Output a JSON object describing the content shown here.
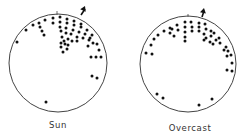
{
  "diagrams": [
    {
      "id": "sun",
      "label": "Sun",
      "circle": {
        "cx": 58,
        "cy": 63,
        "r": 49
      },
      "tick": {
        "x": 57,
        "y1": 11,
        "y2": 15
      },
      "arrow": {
        "x1": 81,
        "y1": 15,
        "x2": 85,
        "y2": 6
      },
      "dots": [
        [
          17,
          42
        ],
        [
          26,
          30
        ],
        [
          33,
          25
        ],
        [
          39,
          23
        ],
        [
          45,
          20
        ],
        [
          53,
          18
        ],
        [
          60,
          17
        ],
        [
          67,
          19
        ],
        [
          74,
          21
        ],
        [
          81,
          24
        ],
        [
          40,
          27
        ],
        [
          42,
          31
        ],
        [
          44,
          35
        ],
        [
          53,
          23
        ],
        [
          60,
          22
        ],
        [
          67,
          23
        ],
        [
          74,
          25
        ],
        [
          81,
          27
        ],
        [
          87,
          30
        ],
        [
          92,
          35
        ],
        [
          60,
          27
        ],
        [
          66,
          28
        ],
        [
          73,
          30
        ],
        [
          79,
          32
        ],
        [
          85,
          34
        ],
        [
          90,
          38
        ],
        [
          61,
          31
        ],
        [
          66,
          33
        ],
        [
          71,
          34
        ],
        [
          77,
          37
        ],
        [
          83,
          38
        ],
        [
          89,
          40
        ],
        [
          93,
          43
        ],
        [
          97,
          44
        ],
        [
          62,
          37
        ],
        [
          64,
          41
        ],
        [
          68,
          39
        ],
        [
          72,
          41
        ],
        [
          77,
          41
        ],
        [
          61,
          43
        ],
        [
          65,
          44
        ],
        [
          68,
          45
        ],
        [
          88,
          46
        ],
        [
          61,
          47
        ],
        [
          67,
          49
        ],
        [
          63,
          52
        ],
        [
          99,
          50
        ],
        [
          91,
          57
        ],
        [
          96,
          57
        ],
        [
          101,
          57
        ],
        [
          92,
          76
        ],
        [
          97,
          78
        ],
        [
          46,
          102
        ]
      ]
    },
    {
      "id": "overcast",
      "label": "Overcast",
      "circle": {
        "cx": 188,
        "cy": 64,
        "r": 48
      },
      "tick": {
        "x": 188,
        "y1": 14,
        "y2": 17
      },
      "arrow": {
        "x1": 202,
        "y1": 17,
        "x2": 204,
        "y2": 8
      },
      "dots": [
        [
          146,
          53
        ],
        [
          151,
          45
        ],
        [
          154,
          39
        ],
        [
          158,
          35
        ],
        [
          164,
          31
        ],
        [
          170,
          28
        ],
        [
          170,
          33
        ],
        [
          172,
          29
        ],
        [
          174,
          36
        ],
        [
          177,
          25
        ],
        [
          178,
          30
        ],
        [
          185,
          22
        ],
        [
          185,
          27
        ],
        [
          185,
          32
        ],
        [
          185,
          37
        ],
        [
          185,
          41
        ],
        [
          191,
          22
        ],
        [
          192,
          27
        ],
        [
          192,
          31
        ],
        [
          199,
          23
        ],
        [
          199,
          27
        ],
        [
          199,
          31
        ],
        [
          205,
          24
        ],
        [
          206,
          29
        ],
        [
          204,
          34
        ],
        [
          204,
          40
        ],
        [
          211,
          31
        ],
        [
          211,
          36
        ],
        [
          210,
          42
        ],
        [
          206,
          38
        ],
        [
          214,
          33
        ],
        [
          219,
          38
        ],
        [
          216,
          40
        ],
        [
          220,
          43
        ],
        [
          226,
          47
        ],
        [
          213,
          44
        ],
        [
          224,
          50
        ],
        [
          228,
          51
        ],
        [
          227,
          56
        ],
        [
          231,
          55
        ],
        [
          232,
          63
        ],
        [
          227,
          70
        ],
        [
          232,
          71
        ],
        [
          152,
          54
        ],
        [
          157,
          94
        ],
        [
          163,
          98
        ],
        [
          199,
          105
        ],
        [
          212,
          99
        ]
      ]
    }
  ],
  "colors": {
    "ink": "#111111",
    "circle_stroke": "#444444",
    "background": "#ffffff"
  }
}
